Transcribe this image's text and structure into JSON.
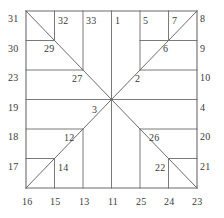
{
  "figure": {
    "type": "geometric-diagram",
    "stroke_color": "#6b6b6b",
    "label_color": "#3a3a3a",
    "background_color": "#ffffff",
    "square": {
      "left": 26,
      "top": 11,
      "right": 197,
      "bottom": 188
    },
    "grid": {
      "vertical_x": [
        26,
        54.5,
        83,
        111.5,
        140,
        168.5,
        197
      ],
      "horizontal_y": [
        11,
        40.5,
        70,
        99.5,
        129,
        158.5,
        188
      ]
    },
    "diagonals": [
      {
        "name": "top-left-to-center",
        "x1": 26,
        "y1": 11,
        "x2": 111.5,
        "y2": 99.5
      },
      {
        "name": "center-to-bottom-right",
        "x1": 111.5,
        "y1": 99.5,
        "x2": 197,
        "y2": 188
      },
      {
        "name": "bottom-left-to-center",
        "x1": 26,
        "y1": 188,
        "x2": 111.5,
        "y2": 99.5
      },
      {
        "name": "center-to-top-right",
        "x1": 111.5,
        "y1": 99.5,
        "x2": 197,
        "y2": 11
      }
    ],
    "segments": [
      {
        "name": "border-top",
        "x1": 26,
        "y1": 11,
        "x2": 197,
        "y2": 11
      },
      {
        "name": "border-bottom",
        "x1": 26,
        "y1": 188,
        "x2": 197,
        "y2": 188
      },
      {
        "name": "border-left",
        "x1": 26,
        "y1": 11,
        "x2": 26,
        "y2": 188
      },
      {
        "name": "border-right",
        "x1": 197,
        "y1": 11,
        "x2": 197,
        "y2": 188
      },
      {
        "name": "h-left-1",
        "x1": 26,
        "y1": 40.5,
        "x2": 54.5,
        "y2": 40.5
      },
      {
        "name": "h-left-2",
        "x1": 26,
        "y1": 70,
        "x2": 83,
        "y2": 70
      },
      {
        "name": "h-left-3",
        "x1": 26,
        "y1": 99.5,
        "x2": 111.5,
        "y2": 99.5
      },
      {
        "name": "h-left-4",
        "x1": 26,
        "y1": 129,
        "x2": 83,
        "y2": 129
      },
      {
        "name": "h-left-5",
        "x1": 26,
        "y1": 158.5,
        "x2": 54.5,
        "y2": 158.5
      },
      {
        "name": "h-right-1",
        "x1": 140,
        "y1": 40.5,
        "x2": 197,
        "y2": 40.5
      },
      {
        "name": "h-right-2",
        "x1": 140,
        "y1": 70,
        "x2": 197,
        "y2": 70
      },
      {
        "name": "h-right-3",
        "x1": 111.5,
        "y1": 99.5,
        "x2": 197,
        "y2": 99.5
      },
      {
        "name": "h-right-4",
        "x1": 140,
        "y1": 129,
        "x2": 197,
        "y2": 129
      },
      {
        "name": "h-right-5",
        "x1": 168.5,
        "y1": 158.5,
        "x2": 197,
        "y2": 158.5
      },
      {
        "name": "v-top-1",
        "x1": 54.5,
        "y1": 11,
        "x2": 54.5,
        "y2": 40.5
      },
      {
        "name": "v-top-2",
        "x1": 83,
        "y1": 11,
        "x2": 83,
        "y2": 70
      },
      {
        "name": "v-top-3",
        "x1": 111.5,
        "y1": 11,
        "x2": 111.5,
        "y2": 99.5
      },
      {
        "name": "v-top-4",
        "x1": 140,
        "y1": 11,
        "x2": 140,
        "y2": 70
      },
      {
        "name": "v-top-5",
        "x1": 168.5,
        "y1": 11,
        "x2": 168.5,
        "y2": 40.5
      },
      {
        "name": "v-bot-1",
        "x1": 54.5,
        "y1": 158.5,
        "x2": 54.5,
        "y2": 188
      },
      {
        "name": "v-bot-2",
        "x1": 83,
        "y1": 129,
        "x2": 83,
        "y2": 188
      },
      {
        "name": "v-bot-3",
        "x1": 111.5,
        "y1": 99.5,
        "x2": 111.5,
        "y2": 188
      },
      {
        "name": "v-bot-4",
        "x1": 140,
        "y1": 129,
        "x2": 140,
        "y2": 188
      },
      {
        "name": "v-bot-5",
        "x1": 168.5,
        "y1": 158.5,
        "x2": 168.5,
        "y2": 188
      }
    ]
  },
  "labels": {
    "top": [
      {
        "text": "31",
        "x": 8,
        "y": 14
      },
      {
        "text": "32",
        "x": 58,
        "y": 16
      },
      {
        "text": "33",
        "x": 86,
        "y": 16
      },
      {
        "text": "1",
        "x": 115,
        "y": 16
      },
      {
        "text": "5",
        "x": 143,
        "y": 16
      },
      {
        "text": "7",
        "x": 172,
        "y": 16
      },
      {
        "text": "8",
        "x": 200,
        "y": 14
      }
    ],
    "left": [
      {
        "text": "30",
        "x": 8,
        "y": 44
      },
      {
        "text": "23",
        "x": 8,
        "y": 73
      },
      {
        "text": "19",
        "x": 8,
        "y": 103
      },
      {
        "text": "18",
        "x": 8,
        "y": 132
      },
      {
        "text": "17",
        "x": 8,
        "y": 162
      }
    ],
    "right": [
      {
        "text": "9",
        "x": 200,
        "y": 44
      },
      {
        "text": "10",
        "x": 200,
        "y": 73
      },
      {
        "text": "4",
        "x": 200,
        "y": 103
      },
      {
        "text": "20",
        "x": 200,
        "y": 132
      },
      {
        "text": "21",
        "x": 200,
        "y": 162
      }
    ],
    "bottom": [
      {
        "text": "16",
        "x": 22,
        "y": 197
      },
      {
        "text": "15",
        "x": 50,
        "y": 197
      },
      {
        "text": "13",
        "x": 79,
        "y": 197
      },
      {
        "text": "11",
        "x": 108,
        "y": 197
      },
      {
        "text": "25",
        "x": 136,
        "y": 197
      },
      {
        "text": "24",
        "x": 164,
        "y": 197
      },
      {
        "text": "23",
        "x": 192,
        "y": 197
      }
    ],
    "interior": [
      {
        "text": "29",
        "x": 44,
        "y": 44
      },
      {
        "text": "27",
        "x": 72,
        "y": 74
      },
      {
        "text": "3",
        "x": 92,
        "y": 105
      },
      {
        "text": "12",
        "x": 64,
        "y": 133
      },
      {
        "text": "14",
        "x": 58,
        "y": 163
      },
      {
        "text": "6",
        "x": 163,
        "y": 44
      },
      {
        "text": "2",
        "x": 135,
        "y": 74
      },
      {
        "text": "26",
        "x": 149,
        "y": 133
      },
      {
        "text": "22",
        "x": 155,
        "y": 163
      }
    ]
  }
}
